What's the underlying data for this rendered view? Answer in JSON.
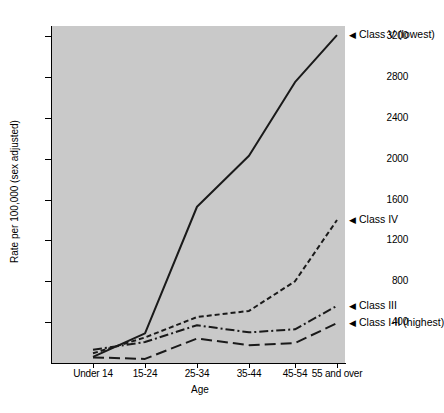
{
  "chart_data": {
    "type": "line",
    "title": "",
    "xlabel": "Age",
    "ylabel": "Rate per 100,000 (sex adjusted)",
    "categories": [
      "Under 14",
      "15-24",
      "25-34",
      "35-44",
      "45-54",
      "55 and over"
    ],
    "ylim": [
      0,
      3300
    ],
    "yticks": [
      400,
      800,
      1200,
      1600,
      2000,
      2400,
      2800,
      3200
    ],
    "ytick_labels": [
      "400",
      "800",
      "1200",
      "1600",
      "2000",
      "2400",
      "2800",
      "3200"
    ],
    "grid": false,
    "legend_position": "right-inline",
    "series": [
      {
        "name": "Class V (lowest)",
        "label": "Class V (lowest)",
        "marker": "◀",
        "style": "solid",
        "color": "#1a1a1a",
        "values": [
          60,
          290,
          1530,
          2030,
          2750,
          3210
        ]
      },
      {
        "name": "Class IV",
        "label": "Class IV",
        "marker": "◀",
        "style": "dashed",
        "color": "#1a1a1a",
        "values": [
          95,
          250,
          450,
          510,
          800,
          1400
        ]
      },
      {
        "name": "Class III",
        "label": "Class III",
        "marker": "◀",
        "style": "dashdot",
        "color": "#1a1a1a",
        "values": [
          130,
          205,
          370,
          300,
          330,
          560
        ]
      },
      {
        "name": "Class I-II (highest)",
        "label": "Class I-II (highest)",
        "marker": "◀",
        "style": "longdash",
        "color": "#1a1a1a",
        "values": [
          55,
          40,
          240,
          175,
          195,
          390
        ]
      }
    ]
  }
}
